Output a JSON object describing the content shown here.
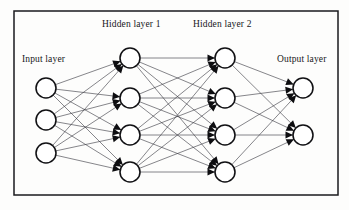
{
  "figure": {
    "frame": {
      "x": 14,
      "y": 11,
      "width": 324,
      "height": 184,
      "color": "#1a1a1e"
    },
    "canvas": {
      "width": 349,
      "height": 210,
      "background": "#fdfdfc"
    }
  },
  "labels": {
    "input": "Input layer",
    "hidden1": "Hidden layer 1",
    "hidden2": "Hidden layer 2",
    "output": "Output layer"
  },
  "label_positions": {
    "input": {
      "x": 22,
      "y": 62
    },
    "hidden1": {
      "x": 102,
      "y": 27
    },
    "hidden2": {
      "x": 193,
      "y": 27
    },
    "output": {
      "x": 277,
      "y": 62
    }
  },
  "style": {
    "node_fill": "#ffffff",
    "node_stroke": "#111114",
    "node_stroke_width": 1.55,
    "node_radius": 10,
    "edge_color": "#3b3b42",
    "edge_width": 0.62,
    "arrow_color": "#0d0d10",
    "arrow_length": 7.5,
    "arrow_half_width": 3.6,
    "text_color": "#17171a",
    "font_size": 9.5
  },
  "network": {
    "architecture": [
      3,
      4,
      4,
      2
    ],
    "connection_pattern": "fully-connected",
    "direction": "left-to-right",
    "arrowheads_on": [
      "hidden1",
      "hidden2",
      "output"
    ],
    "layers": [
      {
        "id": "input",
        "name": "Input layer",
        "node_count": 3,
        "nodes": [
          {
            "id": "i1",
            "cx": 46,
            "cy": 88,
            "r": 10
          },
          {
            "id": "i2",
            "cx": 46,
            "cy": 120,
            "r": 10
          },
          {
            "id": "i3",
            "cx": 46,
            "cy": 153,
            "r": 10
          }
        ]
      },
      {
        "id": "hidden1",
        "name": "Hidden layer 1",
        "node_count": 4,
        "nodes": [
          {
            "id": "h1a",
            "cx": 130,
            "cy": 58,
            "r": 10
          },
          {
            "id": "h1b",
            "cx": 130,
            "cy": 98,
            "r": 10
          },
          {
            "id": "h1c",
            "cx": 130,
            "cy": 135,
            "r": 10
          },
          {
            "id": "h1d",
            "cx": 130,
            "cy": 172,
            "r": 10
          }
        ]
      },
      {
        "id": "hidden2",
        "name": "Hidden layer 2",
        "node_count": 4,
        "nodes": [
          {
            "id": "h2a",
            "cx": 225,
            "cy": 58,
            "r": 10
          },
          {
            "id": "h2b",
            "cx": 225,
            "cy": 98,
            "r": 10
          },
          {
            "id": "h2c",
            "cx": 225,
            "cy": 135,
            "r": 10
          },
          {
            "id": "h2d",
            "cx": 225,
            "cy": 172,
            "r": 10
          }
        ]
      },
      {
        "id": "output",
        "name": "Output layer",
        "node_count": 2,
        "nodes": [
          {
            "id": "o1",
            "cx": 303,
            "cy": 88,
            "r": 10
          },
          {
            "id": "o2",
            "cx": 303,
            "cy": 135,
            "r": 10
          }
        ]
      }
    ]
  }
}
